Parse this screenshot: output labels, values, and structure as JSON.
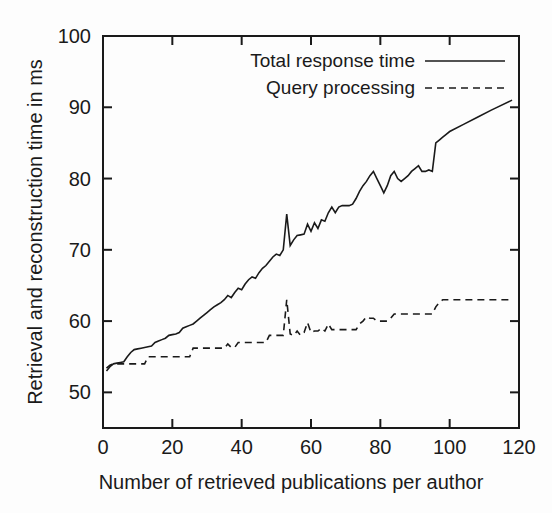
{
  "chart_data": {
    "type": "line",
    "title": "",
    "xlabel": "Number of retrieved publications per author",
    "ylabel": "Retrieval and reconstruction time in ms",
    "xlim": [
      0,
      120
    ],
    "ylim": [
      45,
      100
    ],
    "xticks": [
      0,
      20,
      40,
      60,
      80,
      100,
      120
    ],
    "yticks": [
      50,
      60,
      70,
      80,
      90,
      100
    ],
    "xtick_labels": [
      "0",
      "20",
      "40",
      "60",
      "80",
      "100",
      "120"
    ],
    "ytick_labels": [
      "50",
      "60",
      "70",
      "80",
      "90",
      "100"
    ],
    "grid": false,
    "legend_position": "top-right-inside",
    "series": [
      {
        "name": "Total response time",
        "style": "solid",
        "color": "#1a1a1a",
        "x": [
          1,
          2,
          3,
          4,
          5,
          6,
          7,
          8,
          9,
          10,
          11,
          12,
          13,
          14,
          15,
          16,
          17,
          18,
          19,
          20,
          21,
          22,
          23,
          24,
          25,
          26,
          27,
          28,
          29,
          30,
          31,
          32,
          33,
          34,
          35,
          36,
          37,
          38,
          39,
          40,
          41,
          42,
          43,
          44,
          45,
          46,
          47,
          48,
          49,
          50,
          51,
          52,
          53,
          54,
          55,
          56,
          57,
          58,
          59,
          60,
          61,
          62,
          63,
          64,
          65,
          66,
          67,
          68,
          69,
          70,
          71,
          72,
          73,
          74,
          75,
          76,
          77,
          78,
          79,
          80,
          81,
          82,
          83,
          84,
          85,
          86,
          87,
          88,
          89,
          90,
          91,
          92,
          93,
          94,
          95,
          96,
          97,
          98,
          99,
          100,
          104,
          108,
          112,
          118
        ],
        "y": [
          53.0,
          53.6,
          54.0,
          54.1,
          54.2,
          54.3,
          55.0,
          55.6,
          56.0,
          56.1,
          56.2,
          56.3,
          56.4,
          56.5,
          57.0,
          57.2,
          57.4,
          57.6,
          58.0,
          58.1,
          58.2,
          58.4,
          59.0,
          59.2,
          59.4,
          59.6,
          60.0,
          60.4,
          60.8,
          61.2,
          61.6,
          62.0,
          62.3,
          62.6,
          63.0,
          63.6,
          63.3,
          64.0,
          64.6,
          64.4,
          65.2,
          65.8,
          66.2,
          66.0,
          66.8,
          67.4,
          67.8,
          68.4,
          69.0,
          69.4,
          69.2,
          70.0,
          75.0,
          70.6,
          71.4,
          72.0,
          72.1,
          72.2,
          73.6,
          72.6,
          73.8,
          73.0,
          74.2,
          74.0,
          75.2,
          76.0,
          75.2,
          76.0,
          76.2,
          76.2,
          76.2,
          76.4,
          77.2,
          78.2,
          79.0,
          79.6,
          80.4,
          81.0,
          80.0,
          79.0,
          78.0,
          79.0,
          80.4,
          81.0,
          80.0,
          79.6,
          80.0,
          80.4,
          81.0,
          81.4,
          81.8,
          81.0,
          81.0,
          81.2,
          81.0,
          85.0,
          85.4,
          85.8,
          86.2,
          86.6,
          87.6,
          88.6,
          89.6,
          91.0
        ]
      },
      {
        "name": "Query processing",
        "style": "dashed",
        "color": "#1a1a1a",
        "x": [
          1,
          2,
          3,
          4,
          5,
          6,
          7,
          8,
          9,
          10,
          11,
          12,
          13,
          14,
          15,
          16,
          17,
          18,
          19,
          20,
          21,
          22,
          23,
          24,
          25,
          26,
          27,
          28,
          29,
          30,
          31,
          32,
          33,
          34,
          35,
          36,
          37,
          38,
          39,
          40,
          41,
          42,
          43,
          44,
          45,
          46,
          47,
          48,
          49,
          50,
          51,
          52,
          53,
          54,
          55,
          56,
          57,
          58,
          59,
          60,
          61,
          62,
          63,
          64,
          65,
          66,
          67,
          68,
          69,
          70,
          71,
          72,
          73,
          74,
          75,
          76,
          77,
          78,
          79,
          80,
          81,
          82,
          83,
          84,
          85,
          86,
          87,
          88,
          89,
          90,
          91,
          92,
          93,
          94,
          95,
          96,
          97,
          98,
          99,
          100,
          104,
          108,
          112,
          118
        ],
        "y": [
          53.4,
          53.8,
          54.0,
          54.0,
          54.0,
          54.0,
          54.0,
          54.0,
          54.0,
          54.0,
          54.0,
          54.0,
          55.0,
          55.0,
          55.0,
          55.0,
          55.0,
          55.0,
          55.0,
          55.0,
          55.0,
          55.0,
          55.0,
          55.0,
          55.0,
          56.2,
          56.2,
          56.2,
          56.2,
          56.2,
          56.2,
          56.2,
          56.2,
          56.2,
          56.2,
          56.8,
          56.3,
          56.3,
          57.0,
          57.0,
          57.0,
          57.0,
          57.0,
          57.0,
          57.0,
          57.0,
          57.0,
          58.0,
          58.0,
          58.0,
          58.0,
          58.0,
          63.0,
          58.2,
          58.0,
          58.6,
          58.0,
          58.4,
          59.8,
          58.4,
          58.6,
          58.6,
          59.0,
          58.6,
          59.6,
          58.8,
          58.8,
          58.8,
          58.8,
          58.8,
          58.8,
          58.8,
          58.8,
          59.6,
          60.0,
          60.6,
          60.4,
          60.4,
          60.0,
          60.0,
          60.0,
          60.0,
          60.4,
          61.0,
          61.0,
          61.0,
          61.0,
          61.0,
          61.0,
          61.0,
          61.0,
          61.0,
          61.0,
          61.0,
          61.0,
          62.0,
          62.6,
          63.0,
          63.0,
          63.0,
          63.0,
          63.0,
          63.0,
          63.0
        ]
      }
    ]
  },
  "legend": {
    "items": [
      {
        "label": "Total response time",
        "style": "solid"
      },
      {
        "label": "Query processing",
        "style": "dashed"
      }
    ]
  }
}
